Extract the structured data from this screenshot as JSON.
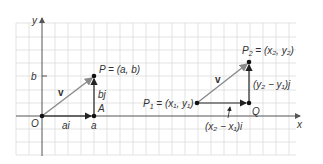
{
  "diagram": {
    "colors": {
      "grid": "#d9d9d9",
      "axis": "#555555",
      "vector_v": "#8a8a8a",
      "components": "#222222",
      "point": "#111111",
      "text": "#333333"
    },
    "axes": {
      "x_label": "x",
      "y_label": "y",
      "origin_label": "O",
      "x_tick_label": "a",
      "y_tick_label": "b"
    },
    "left_figure": {
      "point_P_label": "P = (a, b)",
      "point_A_label": "A",
      "vector_label": "v",
      "horizontal_component_label": "ai",
      "vertical_component_label": "bj"
    },
    "right_figure": {
      "point_P1_label": "P",
      "point_P1_sub": "1",
      "point_P1_coords": " = (x₁, y₁)",
      "point_P2_label": "P",
      "point_P2_sub": "2",
      "point_P2_coords": " = (x₂, y₂)",
      "point_Q_label": "Q",
      "vector_label": "v",
      "horizontal_component_label": "(x₂ − x₁)i",
      "vertical_component_label": "(y₂ − y₁)j"
    }
  }
}
